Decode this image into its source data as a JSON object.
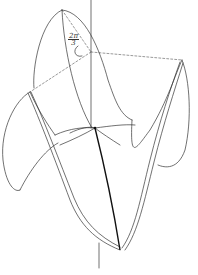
{
  "figure": {
    "annotation": {
      "numerator": "2π",
      "denominator": "3"
    },
    "colors": {
      "ink": "#333333",
      "background": "#ffffff"
    }
  }
}
